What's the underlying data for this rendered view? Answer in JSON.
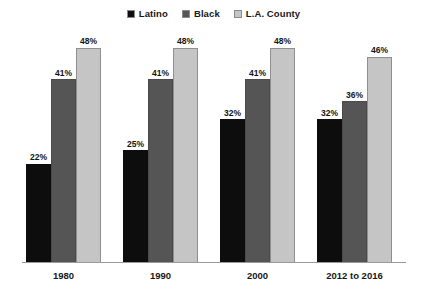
{
  "chart_data": {
    "type": "bar",
    "title": "",
    "subtitle": "",
    "xlabel": "",
    "ylabel": "",
    "ylim": [
      0,
      52
    ],
    "grid": false,
    "legend_position": "top-center",
    "value_label_suffix": "%",
    "categories": [
      "1980",
      "1990",
      "2000",
      "2012 to 2016"
    ],
    "series": [
      {
        "name": "Latino",
        "color": "#0d0d0d",
        "values": [
          22,
          25,
          32,
          32
        ],
        "labels": [
          "22%",
          "25%",
          "32%",
          "32%"
        ]
      },
      {
        "name": "Black",
        "color": "#555555",
        "values": [
          41,
          41,
          41,
          36
        ],
        "labels": [
          "41%",
          "41%",
          "41%",
          "36%"
        ]
      },
      {
        "name": "L.A. County",
        "color": "#c5c5c5",
        "values": [
          48,
          48,
          48,
          46
        ],
        "labels": [
          "48%",
          "48%",
          "48%",
          "46%"
        ]
      }
    ]
  },
  "legend": {
    "entries": [
      {
        "label": "Latino",
        "swatch": "legend-swatch-latino"
      },
      {
        "label": "Black",
        "swatch": "legend-swatch-black"
      },
      {
        "label": "L.A. County",
        "swatch": "legend-swatch-la-county"
      }
    ]
  },
  "axis": {
    "tick_labels": [
      "1980",
      "1990",
      "2000",
      "2012 to 2016"
    ]
  }
}
